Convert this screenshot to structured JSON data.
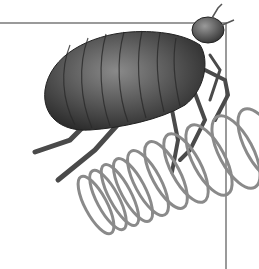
{
  "image": {
    "subject": "flea-on-spring-illustration",
    "colors": {
      "background": "#ffffff",
      "frame_line": "#9a9a9a",
      "body_dark": "#3a3a3a",
      "body_mid": "#6e6e6e",
      "body_light": "#a8a8a8",
      "spring": "#8a8a8a"
    }
  }
}
